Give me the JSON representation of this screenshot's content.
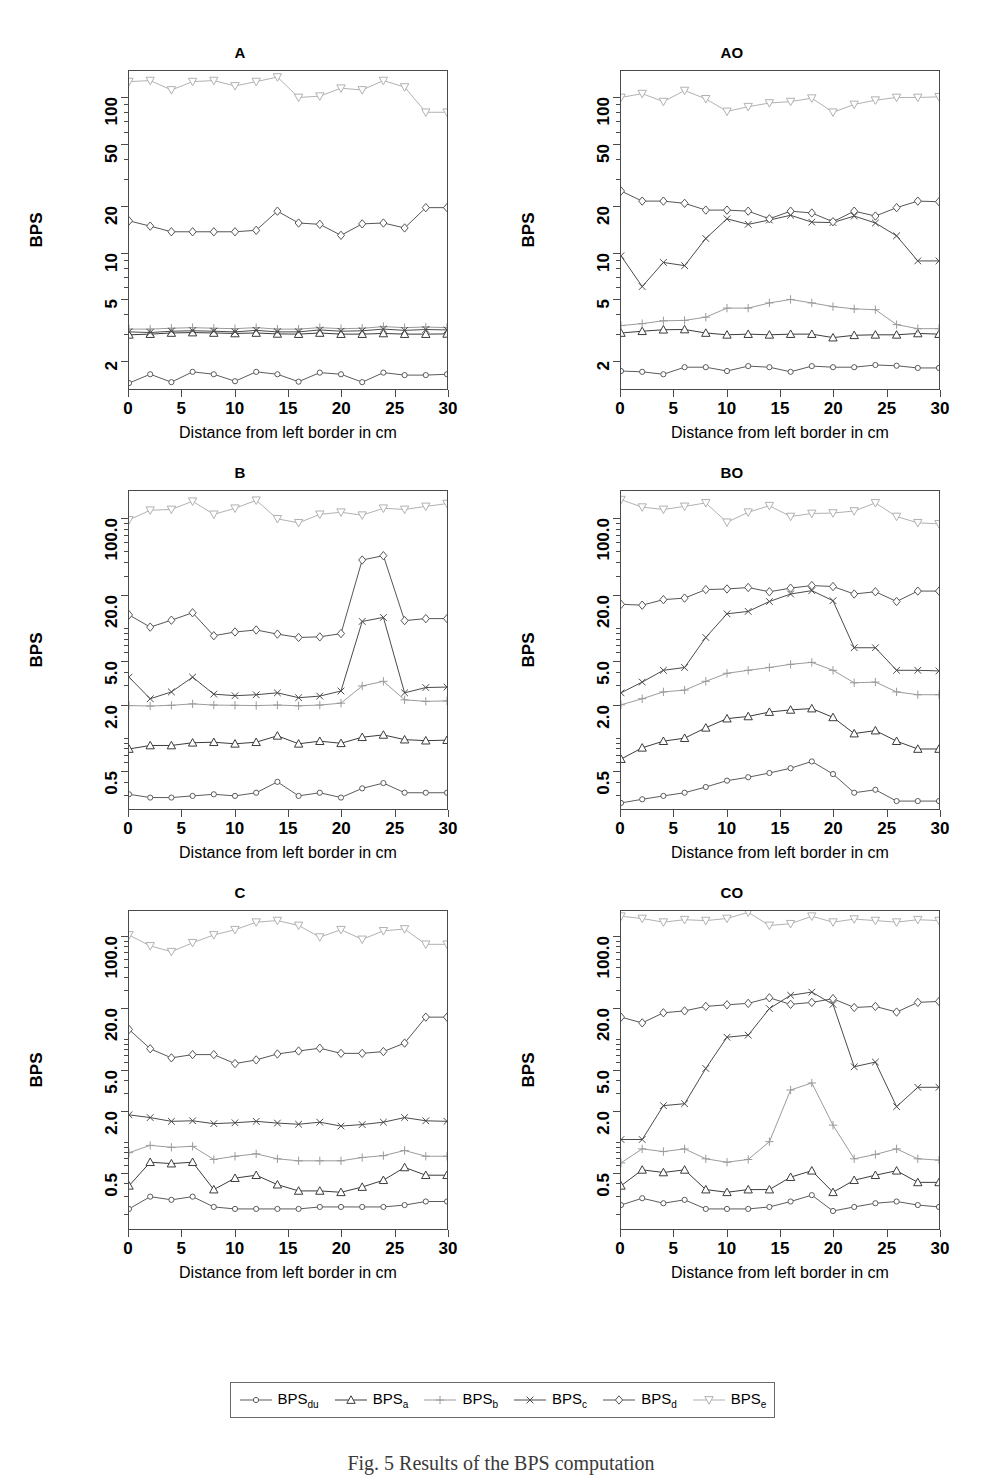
{
  "figure": {
    "caption": "Fig. 5  Results of the BPS computation",
    "xlabel": "Distance from left border in cm",
    "ylabel": "BPS"
  },
  "legend": {
    "entries": [
      {
        "label": "BPS",
        "sub": "du",
        "marker": "circle",
        "color": "#5a5a5a"
      },
      {
        "label": "BPS",
        "sub": "a",
        "marker": "triangle-up",
        "color": "#3a3a3a"
      },
      {
        "label": "BPS",
        "sub": "b",
        "marker": "plus",
        "color": "#9a9a9a"
      },
      {
        "label": "BPS",
        "sub": "c",
        "marker": "cross",
        "color": "#4a4a4a"
      },
      {
        "label": "BPS",
        "sub": "d",
        "marker": "diamond",
        "color": "#555555"
      },
      {
        "label": "BPS",
        "sub": "e",
        "marker": "triangle-down",
        "color": "#b0b0b0"
      }
    ]
  },
  "chart_data": [
    {
      "type": "line",
      "title": "A",
      "xlabel": "Distance from left border in cm",
      "ylabel": "BPS",
      "yscale": "log",
      "xlim": [
        0,
        30
      ],
      "ylim": [
        1.3,
        150
      ],
      "xticks": [
        0,
        5,
        10,
        15,
        20,
        25,
        30
      ],
      "yticks": [
        2,
        5,
        10,
        20,
        50,
        100
      ],
      "ytick_labels": [
        "2",
        "5",
        "10",
        "20",
        "50",
        "100"
      ],
      "x": [
        0,
        2,
        4,
        6,
        8,
        10,
        12,
        14,
        16,
        18,
        20,
        22,
        24,
        26,
        28,
        30
      ],
      "series": [
        {
          "name": "BPS_du",
          "values": [
            1.42,
            1.62,
            1.44,
            1.68,
            1.62,
            1.46,
            1.68,
            1.62,
            1.45,
            1.66,
            1.62,
            1.44,
            1.66,
            1.6,
            1.6,
            1.62
          ]
        },
        {
          "name": "BPS_a",
          "values": [
            2.92,
            2.95,
            3.0,
            3.02,
            3.0,
            2.98,
            3.0,
            2.96,
            2.95,
            3.0,
            2.95,
            2.95,
            2.98,
            2.95,
            2.95,
            2.96
          ]
        },
        {
          "name": "BPS_b",
          "values": [
            3.18,
            3.18,
            3.22,
            3.25,
            3.22,
            3.2,
            3.25,
            3.18,
            3.18,
            3.25,
            3.2,
            3.22,
            3.3,
            3.25,
            3.28,
            3.25
          ]
        },
        {
          "name": "BPS_c",
          "values": [
            3.05,
            3.02,
            3.08,
            3.1,
            3.08,
            3.05,
            3.12,
            3.05,
            3.05,
            3.14,
            3.08,
            3.1,
            3.18,
            3.12,
            3.16,
            3.14
          ]
        },
        {
          "name": "BPS_d",
          "values": [
            16.0,
            14.8,
            13.6,
            13.6,
            13.6,
            13.6,
            13.9,
            18.5,
            15.5,
            15.2,
            12.9,
            15.3,
            15.5,
            14.4,
            19.5,
            19.5
          ]
        },
        {
          "name": "BPS_e",
          "values": [
            128,
            130,
            113,
            128,
            130,
            120,
            128,
            137,
            101,
            103,
            116,
            113,
            130,
            118,
            81,
            81
          ]
        }
      ]
    },
    {
      "type": "line",
      "title": "AO",
      "xlabel": "Distance from left border in cm",
      "ylabel": "BPS",
      "yscale": "log",
      "xlim": [
        0,
        30
      ],
      "ylim": [
        1.3,
        150
      ],
      "xticks": [
        0,
        5,
        10,
        15,
        20,
        25,
        30
      ],
      "yticks": [
        2,
        5,
        10,
        20,
        50,
        100
      ],
      "ytick_labels": [
        "2",
        "5",
        "10",
        "20",
        "50",
        "100"
      ],
      "x": [
        0,
        2,
        4,
        6,
        8,
        10,
        12,
        14,
        16,
        18,
        20,
        22,
        24,
        26,
        28,
        30
      ],
      "series": [
        {
          "name": "BPS_du",
          "values": [
            1.7,
            1.68,
            1.62,
            1.8,
            1.8,
            1.7,
            1.83,
            1.8,
            1.68,
            1.83,
            1.8,
            1.8,
            1.86,
            1.84,
            1.78,
            1.78
          ]
        },
        {
          "name": "BPS_a",
          "values": [
            3.0,
            3.08,
            3.15,
            3.16,
            3.0,
            2.92,
            2.95,
            2.92,
            2.95,
            2.95,
            2.8,
            2.9,
            2.92,
            2.92,
            2.98,
            2.95
          ]
        },
        {
          "name": "BPS_b",
          "values": [
            3.35,
            3.45,
            3.6,
            3.62,
            3.8,
            4.35,
            4.35,
            4.7,
            4.95,
            4.7,
            4.45,
            4.3,
            4.25,
            3.4,
            3.2,
            3.2
          ]
        },
        {
          "name": "BPS_c",
          "values": [
            9.5,
            6.0,
            8.6,
            8.2,
            12.3,
            16.5,
            15.2,
            16.2,
            17.4,
            15.7,
            15.6,
            17.2,
            15.5,
            12.8,
            8.8,
            8.8
          ]
        },
        {
          "name": "BPS_d",
          "values": [
            25.0,
            21.5,
            21.5,
            20.8,
            18.8,
            18.8,
            18.5,
            16.5,
            18.5,
            18.0,
            15.8,
            18.5,
            17.2,
            19.5,
            21.5,
            21.3
          ]
        },
        {
          "name": "BPS_e",
          "values": [
            101,
            107,
            95,
            112,
            99,
            82,
            88,
            93,
            95,
            100,
            81,
            91,
            97,
            101,
            101,
            102
          ]
        }
      ]
    },
    {
      "type": "line",
      "title": "B",
      "xlabel": "Distance from left border in cm",
      "ylabel": "BPS",
      "yscale": "log",
      "xlim": [
        0,
        30
      ],
      "ylim": [
        0.22,
        180
      ],
      "xticks": [
        0,
        5,
        10,
        15,
        20,
        25,
        30
      ],
      "yticks": [
        0.5,
        2.0,
        5.0,
        20.0,
        100.0
      ],
      "ytick_labels": [
        "0.5",
        "2.0",
        "5.0",
        "20.0",
        "100.0"
      ],
      "x": [
        0,
        2,
        4,
        6,
        8,
        10,
        12,
        14,
        16,
        18,
        20,
        22,
        24,
        26,
        28,
        30
      ],
      "series": [
        {
          "name": "BPS_du",
          "values": [
            0.3,
            0.28,
            0.28,
            0.29,
            0.3,
            0.29,
            0.31,
            0.39,
            0.29,
            0.31,
            0.28,
            0.34,
            0.38,
            0.31,
            0.31,
            0.31
          ]
        },
        {
          "name": "BPS_a",
          "values": [
            0.78,
            0.84,
            0.84,
            0.89,
            0.9,
            0.87,
            0.9,
            1.03,
            0.87,
            0.92,
            0.88,
            1.0,
            1.05,
            0.95,
            0.93,
            0.94
          ]
        },
        {
          "name": "BPS_b",
          "values": [
            1.95,
            1.93,
            1.96,
            2.02,
            1.97,
            1.96,
            1.95,
            1.97,
            1.94,
            1.97,
            2.05,
            2.95,
            3.25,
            2.2,
            2.13,
            2.15
          ]
        },
        {
          "name": "BPS_c",
          "values": [
            3.55,
            2.25,
            2.6,
            3.55,
            2.48,
            2.4,
            2.45,
            2.55,
            2.3,
            2.38,
            2.65,
            11.5,
            12.5,
            2.55,
            2.85,
            2.88
          ]
        },
        {
          "name": "BPS_d",
          "values": [
            13.2,
            10.2,
            11.8,
            13.8,
            8.5,
            9.2,
            9.6,
            8.8,
            8.2,
            8.3,
            8.9,
            42.0,
            46.0,
            11.7,
            12.2,
            12.2
          ]
        },
        {
          "name": "BPS_e",
          "values": [
            98,
            120,
            122,
            145,
            110,
            125,
            148,
            100,
            92,
            110,
            115,
            108,
            125,
            122,
            130,
            138
          ]
        }
      ]
    },
    {
      "type": "line",
      "title": "BO",
      "xlabel": "Distance from left border in cm",
      "ylabel": "BPS",
      "yscale": "log",
      "xlim": [
        0,
        30
      ],
      "ylim": [
        0.22,
        180
      ],
      "xticks": [
        0,
        5,
        10,
        15,
        20,
        25,
        30
      ],
      "yticks": [
        0.5,
        2.0,
        5.0,
        20.0,
        100.0
      ],
      "ytick_labels": [
        "0.5",
        "2.0",
        "5.0",
        "20.0",
        "100.0"
      ],
      "x": [
        0,
        2,
        4,
        6,
        8,
        10,
        12,
        14,
        16,
        18,
        20,
        22,
        24,
        26,
        28,
        30
      ],
      "series": [
        {
          "name": "BPS_du",
          "values": [
            0.25,
            0.27,
            0.29,
            0.31,
            0.35,
            0.4,
            0.43,
            0.47,
            0.52,
            0.6,
            0.46,
            0.31,
            0.33,
            0.26,
            0.26,
            0.26
          ]
        },
        {
          "name": "BPS_a",
          "values": [
            0.63,
            0.8,
            0.92,
            0.98,
            1.22,
            1.48,
            1.55,
            1.7,
            1.78,
            1.83,
            1.52,
            1.08,
            1.15,
            0.92,
            0.78,
            0.78
          ]
        },
        {
          "name": "BPS_b",
          "values": [
            1.98,
            2.25,
            2.6,
            2.7,
            3.25,
            3.85,
            4.1,
            4.35,
            4.65,
            4.85,
            4.1,
            3.15,
            3.2,
            2.6,
            2.45,
            2.45
          ]
        },
        {
          "name": "BPS_c",
          "values": [
            2.55,
            3.2,
            4.1,
            4.35,
            8.2,
            13.5,
            14.2,
            17.5,
            20.5,
            22.0,
            17.8,
            6.6,
            6.6,
            4.1,
            4.1,
            4.05
          ]
        },
        {
          "name": "BPS_d",
          "values": [
            16.5,
            16.2,
            18.2,
            18.8,
            22.5,
            22.8,
            23.5,
            21.5,
            23.2,
            24.5,
            24.0,
            20.5,
            21.5,
            17.5,
            21.8,
            21.8
          ]
        },
        {
          "name": "BPS_e",
          "values": [
            150,
            128,
            122,
            130,
            140,
            93,
            115,
            132,
            105,
            112,
            113,
            118,
            140,
            105,
            92,
            90
          ]
        }
      ]
    },
    {
      "type": "line",
      "title": "C",
      "xlabel": "Distance from left border in cm",
      "ylabel": "BPS",
      "yscale": "log",
      "xlim": [
        0,
        30
      ],
      "ylim": [
        0.14,
        180
      ],
      "xticks": [
        0,
        5,
        10,
        15,
        20,
        25,
        30
      ],
      "yticks": [
        0.5,
        2.0,
        5.0,
        20.0,
        100.0
      ],
      "ytick_labels": [
        "0.5",
        "2.0",
        "5.0",
        "20.0",
        "100.0"
      ],
      "x": [
        0,
        2,
        4,
        6,
        8,
        10,
        12,
        14,
        16,
        18,
        20,
        22,
        24,
        26,
        28,
        30
      ],
      "series": [
        {
          "name": "BPS_du",
          "values": [
            0.22,
            0.29,
            0.27,
            0.29,
            0.23,
            0.22,
            0.22,
            0.22,
            0.22,
            0.23,
            0.23,
            0.23,
            0.23,
            0.24,
            0.26,
            0.26
          ]
        },
        {
          "name": "BPS_a",
          "values": [
            0.37,
            0.63,
            0.61,
            0.63,
            0.34,
            0.44,
            0.47,
            0.38,
            0.33,
            0.33,
            0.32,
            0.36,
            0.42,
            0.56,
            0.47,
            0.47
          ]
        },
        {
          "name": "BPS_b",
          "values": [
            0.78,
            0.92,
            0.88,
            0.9,
            0.67,
            0.72,
            0.76,
            0.68,
            0.65,
            0.65,
            0.65,
            0.7,
            0.73,
            0.82,
            0.72,
            0.72
          ]
        },
        {
          "name": "BPS_c",
          "values": [
            1.83,
            1.72,
            1.58,
            1.6,
            1.5,
            1.53,
            1.58,
            1.52,
            1.48,
            1.55,
            1.42,
            1.47,
            1.55,
            1.72,
            1.6,
            1.58
          ]
        },
        {
          "name": "BPS_d",
          "values": [
            12.5,
            8.1,
            6.6,
            7.1,
            7.1,
            5.8,
            6.3,
            7.2,
            7.7,
            8.2,
            7.3,
            7.3,
            7.6,
            9.2,
            16.5,
            16.5
          ]
        },
        {
          "name": "BPS_e",
          "values": [
            105,
            82,
            72,
            88,
            105,
            118,
            140,
            145,
            130,
            100,
            118,
            95,
            115,
            120,
            85,
            85
          ]
        }
      ]
    },
    {
      "type": "line",
      "title": "CO",
      "xlabel": "Distance from left border in cm",
      "ylabel": "BPS",
      "yscale": "log",
      "xlim": [
        0,
        30
      ],
      "ylim": [
        0.14,
        180
      ],
      "xticks": [
        0,
        5,
        10,
        15,
        20,
        25,
        30
      ],
      "yticks": [
        0.5,
        2.0,
        5.0,
        20.0,
        100.0
      ],
      "ytick_labels": [
        "0.5",
        "2.0",
        "5.0",
        "20.0",
        "100.0"
      ],
      "x": [
        0,
        2,
        4,
        6,
        8,
        10,
        12,
        14,
        16,
        18,
        20,
        22,
        24,
        26,
        28,
        30
      ],
      "series": [
        {
          "name": "BPS_du",
          "values": [
            0.24,
            0.28,
            0.25,
            0.27,
            0.22,
            0.22,
            0.22,
            0.23,
            0.26,
            0.3,
            0.21,
            0.23,
            0.25,
            0.26,
            0.24,
            0.23
          ]
        },
        {
          "name": "BPS_a",
          "values": [
            0.37,
            0.53,
            0.5,
            0.53,
            0.34,
            0.32,
            0.34,
            0.34,
            0.45,
            0.52,
            0.32,
            0.42,
            0.47,
            0.52,
            0.4,
            0.4
          ]
        },
        {
          "name": "BPS_b",
          "values": [
            0.62,
            0.85,
            0.8,
            0.85,
            0.68,
            0.63,
            0.67,
            1.0,
            3.2,
            3.75,
            1.45,
            0.68,
            0.75,
            0.85,
            0.68,
            0.66
          ]
        },
        {
          "name": "BPS_c",
          "values": [
            1.05,
            1.05,
            2.25,
            2.35,
            5.2,
            10.5,
            11.0,
            20.0,
            27.0,
            29.0,
            22.0,
            5.4,
            6.0,
            2.2,
            3.4,
            3.4
          ]
        },
        {
          "name": "BPS_d",
          "values": [
            16.5,
            14.5,
            18.2,
            19.0,
            21.0,
            21.8,
            22.5,
            25.5,
            22.0,
            23.0,
            25.0,
            20.5,
            21.0,
            18.5,
            23.0,
            23.5
          ]
        },
        {
          "name": "BPS_e",
          "values": [
            160,
            152,
            140,
            148,
            145,
            152,
            175,
            130,
            135,
            160,
            140,
            150,
            145,
            140,
            148,
            145
          ]
        }
      ]
    }
  ]
}
